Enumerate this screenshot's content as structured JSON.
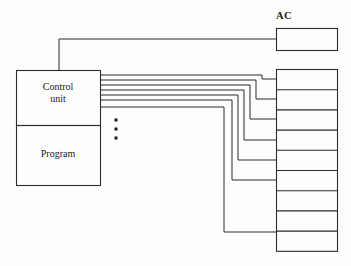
{
  "figure": {
    "background_color": "#fdfdfc",
    "line_color": "#2b2b2b",
    "text_color": "#1a1a1a",
    "width": 351,
    "height": 266
  },
  "blocks": {
    "ac": {
      "label": "AC",
      "label_position": "above-left",
      "x": 276,
      "y": 28,
      "width": 61,
      "height": 22
    },
    "control_unit": {
      "label": "Control\nunit",
      "x": 16,
      "y": 70,
      "width": 84,
      "height": 55
    },
    "program": {
      "label": "Program",
      "x": 16,
      "y": 125,
      "width": 84,
      "height": 60
    }
  },
  "memory_stack": {
    "name": "memory-stack",
    "x": 276,
    "y": 69,
    "width": 61,
    "cell_count": 9,
    "cell_height": 20.2,
    "labels": []
  },
  "ellipsis": {
    "name": "vertical-ellipsis",
    "dot_count": 3,
    "x": 116,
    "dot_positions_y": [
      120,
      129,
      138
    ],
    "dot_size": 3
  },
  "wires": {
    "ac_feed": {
      "name": "control-unit-to-ac-wire",
      "description": "from top of control unit up and right into AC box left edge",
      "points": "59,70 59,39 276,39"
    },
    "bus_lines": [
      {
        "name": "bus-line-1",
        "from_y": 75,
        "turn_x": 262,
        "to_y": 79,
        "entry_x": 276
      },
      {
        "name": "bus-line-2",
        "from_y": 80,
        "turn_x": 256,
        "to_y": 99,
        "entry_x": 276
      },
      {
        "name": "bus-line-3",
        "from_y": 85,
        "turn_x": 250,
        "to_y": 119,
        "entry_x": 276
      },
      {
        "name": "bus-line-4",
        "from_y": 90,
        "turn_x": 244,
        "to_y": 140,
        "entry_x": 276
      },
      {
        "name": "bus-line-5",
        "from_y": 95,
        "turn_x": 238,
        "to_y": 160,
        "entry_x": 276
      },
      {
        "name": "bus-line-6",
        "from_y": 100,
        "turn_x": 232,
        "to_y": 180,
        "entry_x": 276
      },
      {
        "name": "bus-line-7",
        "from_y": 107,
        "turn_x": 224,
        "to_y": 232,
        "entry_x": 276
      }
    ]
  }
}
